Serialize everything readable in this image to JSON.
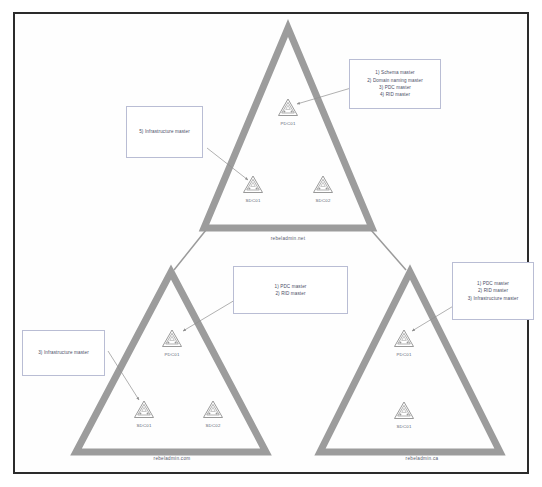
{
  "diagram": {
    "type": "ad-forest-topology",
    "colors": {
      "triangle_stroke": "#9c9c9c",
      "page_border": "#2b2b2b",
      "callout_border": "#b9bdd4",
      "text": "#4a4e66",
      "icon_stroke": "#8d8d8d",
      "connector": "#8f8f8f",
      "background": "#ffffff"
    }
  },
  "domains": [
    {
      "id": "forest-root",
      "name": "rebeladmin.net",
      "role": "forest root domain",
      "servers": [
        {
          "id": "net-pdc01",
          "name": "PDC01",
          "kind": "primary-domain-controller"
        },
        {
          "id": "net-sdc01",
          "name": "SDC01",
          "kind": "secondary-domain-controller"
        },
        {
          "id": "net-sdc02",
          "name": "SDC02",
          "kind": "secondary-domain-controller"
        }
      ]
    },
    {
      "id": "child-com",
      "name": "rebeladmin.com",
      "role": "child domain",
      "servers": [
        {
          "id": "com-pdc01",
          "name": "PDC01",
          "kind": "primary-domain-controller"
        },
        {
          "id": "com-sdc01",
          "name": "SDC01",
          "kind": "secondary-domain-controller"
        },
        {
          "id": "com-sdc02",
          "name": "SDC02",
          "kind": "secondary-domain-controller"
        }
      ]
    },
    {
      "id": "child-ca",
      "name": "rebeladmin.ca",
      "role": "child domain",
      "servers": [
        {
          "id": "ca-pdc01",
          "name": "PDC01",
          "kind": "primary-domain-controller"
        },
        {
          "id": "ca-sdc01",
          "name": "SDC01",
          "kind": "secondary-domain-controller"
        }
      ]
    }
  ],
  "callouts": [
    {
      "id": "callout-root-pdc",
      "target": "net-pdc01",
      "lines": [
        "1) Schema master",
        "2) Domain naming master",
        "3) PDC master",
        "4) RID master"
      ]
    },
    {
      "id": "callout-root-sdc01",
      "target": "net-sdc01",
      "lines": [
        "5) Infrastructure master"
      ]
    },
    {
      "id": "callout-com-pdc",
      "target": "com-pdc01",
      "lines": [
        "1) PDC  master",
        "2) RID  master"
      ]
    },
    {
      "id": "callout-com-sdc01",
      "target": "com-sdc01",
      "lines": [
        "3) Infrastructure  master"
      ]
    },
    {
      "id": "callout-ca-pdc",
      "target": "ca-pdc01",
      "lines": [
        "1) PDC  master",
        "2) RID  master",
        "3) Infrastructure  master"
      ]
    }
  ]
}
